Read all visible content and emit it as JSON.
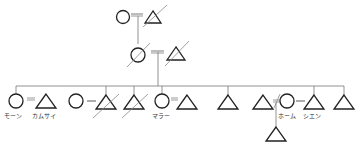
{
  "diagram": {
    "type": "kinship-genealogy",
    "colors": {
      "stroke": "#222222",
      "dead_slash": "#888888",
      "line": "#777777",
      "marriage": "#999999"
    },
    "generations": [
      {
        "level": 1,
        "members": [
          {
            "id": "g1-f",
            "sex": "female",
            "deceased": false
          },
          {
            "id": "g1-m",
            "sex": "male",
            "deceased": true
          }
        ]
      },
      {
        "level": 2,
        "members": [
          {
            "id": "g2-f",
            "sex": "female",
            "deceased": true
          },
          {
            "id": "g2-m",
            "sex": "male",
            "deceased": true
          }
        ]
      },
      {
        "level": 3,
        "members": [
          {
            "id": "c1",
            "sex": "female",
            "deceased": false,
            "label": "モーン"
          },
          {
            "id": "c1-sp",
            "sex": "male",
            "deceased": false,
            "label": "カムサイ"
          },
          {
            "id": "c2-sp",
            "sex": "female",
            "deceased": false
          },
          {
            "id": "c2",
            "sex": "male",
            "deceased": true
          },
          {
            "id": "c3",
            "sex": "male",
            "deceased": true
          },
          {
            "id": "c4",
            "sex": "female",
            "deceased": false,
            "label": "マラー"
          },
          {
            "id": "c4-sp",
            "sex": "male",
            "deceased": false
          },
          {
            "id": "c5",
            "sex": "male",
            "deceased": false
          },
          {
            "id": "c6",
            "sex": "male",
            "deceased": false
          },
          {
            "id": "c6-sp",
            "sex": "female",
            "deceased": false,
            "label": "ホーム"
          },
          {
            "id": "c7",
            "sex": "male",
            "deceased": false,
            "label": "シエン"
          },
          {
            "id": "c8",
            "sex": "male",
            "deceased": false
          }
        ]
      },
      {
        "level": 4,
        "members": [
          {
            "id": "gc1",
            "sex": "male",
            "deceased": false
          }
        ]
      }
    ],
    "labels": {
      "moon": "モーン",
      "kamsai": "カムサイ",
      "mara": "マラー",
      "hom": "ホーム",
      "sien": "シエン"
    }
  }
}
